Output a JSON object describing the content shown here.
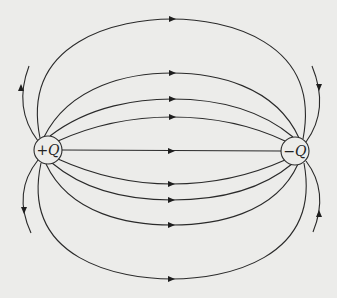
{
  "diagram": {
    "charges": [
      {
        "label": "+Q",
        "cx": 48,
        "cy": 150,
        "r": 14
      },
      {
        "label": "−Q",
        "cx": 295,
        "cy": 151,
        "r": 14
      }
    ],
    "field_line_midpoints_y": [
      19,
      73,
      99,
      117,
      151,
      184,
      200,
      225,
      279
    ],
    "colors": {
      "line": "#2a2a2a",
      "background": "#ececea"
    }
  }
}
